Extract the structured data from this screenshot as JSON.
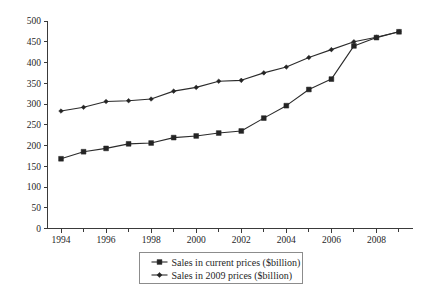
{
  "chart_data": {
    "type": "line",
    "title": "",
    "subtitle": "",
    "xlabel": "",
    "ylabel": "",
    "xlim": [
      1993.4,
      2009.6
    ],
    "ylim": [
      0,
      500
    ],
    "grid": false,
    "legend_position": "bottom-center",
    "x": [
      1994,
      1995,
      1996,
      1997,
      1998,
      1999,
      2000,
      2001,
      2002,
      2003,
      2004,
      2005,
      2006,
      2007,
      2008,
      2009
    ],
    "x_tick_labels": [
      "1994",
      "1996",
      "1998",
      "2000",
      "2002",
      "2004",
      "2006",
      "2008"
    ],
    "x_tick_values": [
      1994,
      1996,
      1998,
      2000,
      2002,
      2004,
      2006,
      2008
    ],
    "x_minor_tick_values": [
      1995,
      1997,
      1999,
      2001,
      2003,
      2005,
      2007,
      2009
    ],
    "y_tick_labels": [
      "0",
      "50",
      "100",
      "150",
      "200",
      "250",
      "300",
      "350",
      "400",
      "450",
      "500"
    ],
    "y_tick_values": [
      0,
      50,
      100,
      150,
      200,
      250,
      300,
      350,
      400,
      450,
      500
    ],
    "series": [
      {
        "name": "Sales in current prices ($billion)",
        "marker": "square",
        "color": "#2b2b2b",
        "values": [
          168,
          185,
          193,
          204,
          206,
          219,
          223,
          230,
          235,
          266,
          296,
          335,
          360,
          440,
          460,
          474
        ]
      },
      {
        "name": "Sales in 2009 prices ($billion)",
        "marker": "diamond",
        "color": "#2b2b2b",
        "values": [
          283,
          292,
          306,
          308,
          312,
          331,
          340,
          355,
          357,
          375,
          389,
          412,
          431,
          450,
          461,
          474
        ]
      }
    ]
  },
  "legend": {
    "entries": [
      {
        "label": "Sales in current prices ($billion)"
      },
      {
        "label": "Sales in 2009 prices ($billion)"
      }
    ]
  }
}
